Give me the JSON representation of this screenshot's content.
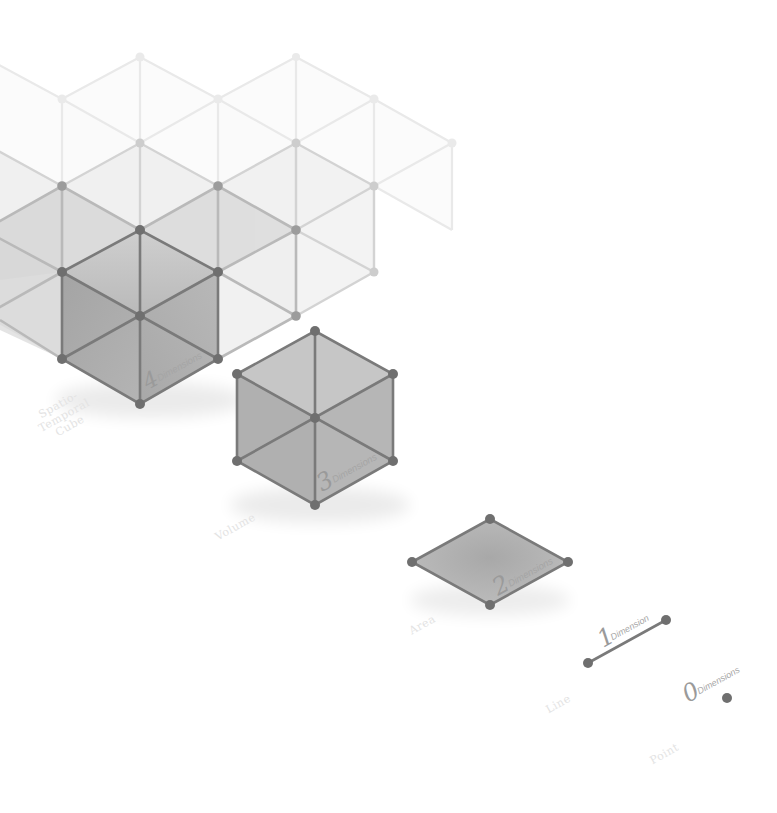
{
  "diagram": {
    "title": "Dimensions",
    "stages": [
      {
        "id": "spatio-temporal-cube",
        "number": "4",
        "unit": "Dimensions",
        "caption_lines": [
          "Spatio-",
          "Temporal",
          "Cube"
        ]
      },
      {
        "id": "volume",
        "number": "3",
        "unit": "Dimensions",
        "caption": "Volume"
      },
      {
        "id": "area",
        "number": "2",
        "unit": "Dimensions",
        "caption": "Area"
      },
      {
        "id": "line",
        "number": "1",
        "unit": "Dimension",
        "caption": "Line"
      },
      {
        "id": "point",
        "number": "0",
        "unit": "Dimensions",
        "caption": "Point"
      }
    ],
    "colors": {
      "background": "#ffffff",
      "edge": "#7a7a7a",
      "vertex": "#6f6f6f",
      "face_dark": "#a9a9a9",
      "face_mid": "#c4c4c4",
      "face_light": "#dcdcdc",
      "caption": "#e3e3e3"
    }
  }
}
